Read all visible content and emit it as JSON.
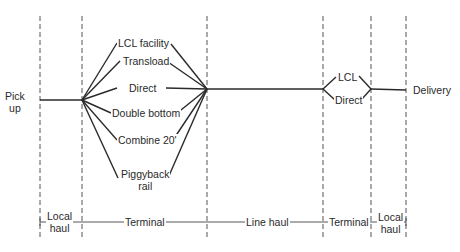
{
  "diagram": {
    "origin": {
      "label_line1": "Pick",
      "label_line2": "up"
    },
    "destination": {
      "label": "Delivery"
    },
    "terminal_options": [
      {
        "id": "lcl-facility",
        "label": "LCL facility"
      },
      {
        "id": "transload",
        "label": "Transload"
      },
      {
        "id": "direct",
        "label": "Direct"
      },
      {
        "id": "double-bottom",
        "label": "Double bottom"
      },
      {
        "id": "combine-20",
        "label": "Combine 20'"
      },
      {
        "id": "piggyback-rail",
        "label_line1": "Piggyback",
        "label_line2": "rail"
      }
    ],
    "destination_terminal_options": [
      {
        "id": "lcl",
        "label": "LCL"
      },
      {
        "id": "direct",
        "label": "Direct"
      }
    ],
    "stages": [
      {
        "id": "local-haul-origin",
        "label_line1": "Local",
        "label_line2": "haul"
      },
      {
        "id": "terminal-origin",
        "label": "Terminal"
      },
      {
        "id": "line-haul",
        "label": "Line haul"
      },
      {
        "id": "terminal-destination",
        "label": "Terminal"
      },
      {
        "id": "local-haul-destination",
        "label_line1": "Local",
        "label_line2": "haul"
      }
    ],
    "colors": {
      "line": "#2a2a2a",
      "background": "#ffffff"
    }
  }
}
